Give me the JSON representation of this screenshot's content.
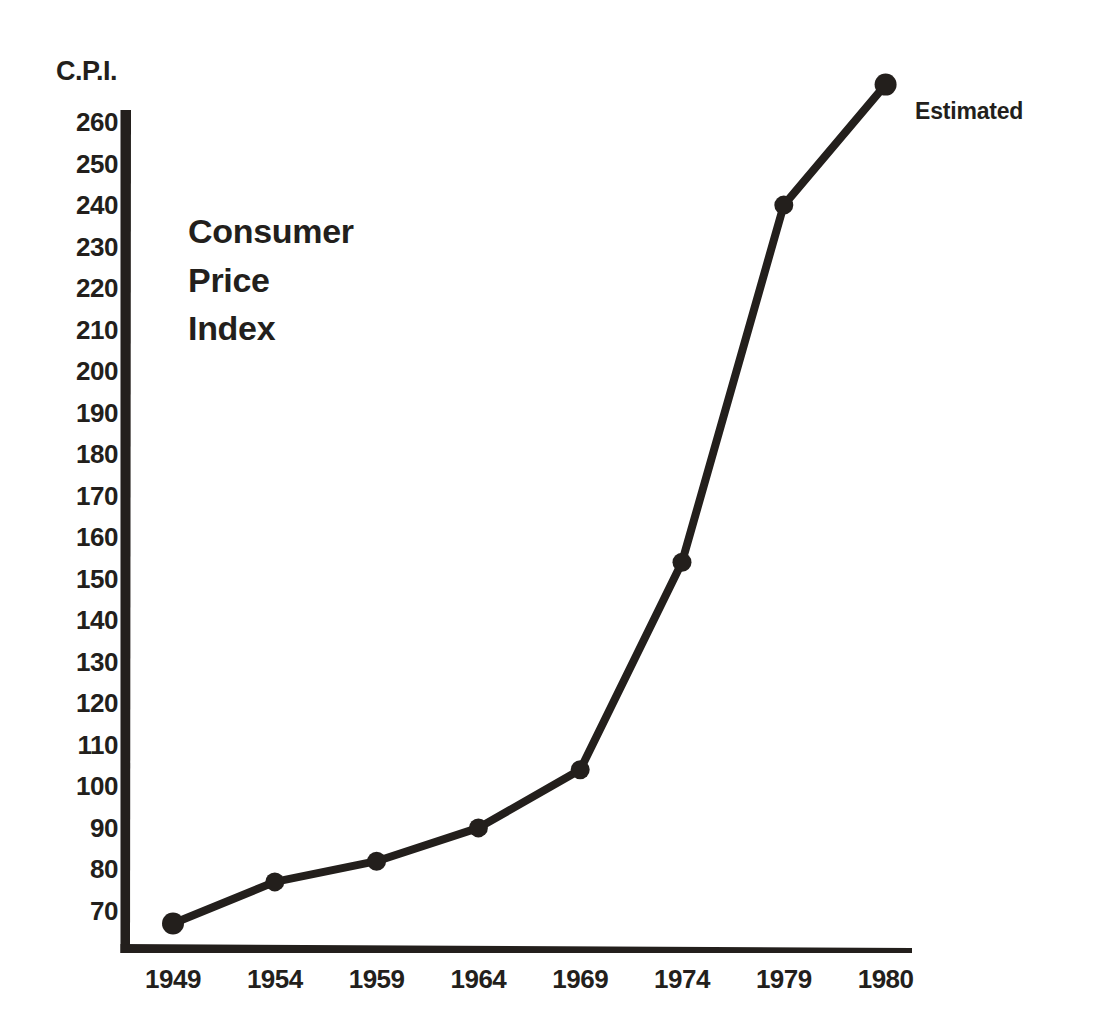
{
  "chart_data": {
    "type": "line",
    "title": "Consumer Price Index",
    "title_lines": [
      "Consumer",
      "Price",
      "Index"
    ],
    "xlabel": "",
    "ylabel": "C.P.I.",
    "categories": [
      "1949",
      "1954",
      "1959",
      "1964",
      "1969",
      "1974",
      "1979",
      "1980"
    ],
    "values": [
      67,
      77,
      82,
      90,
      104,
      154,
      240,
      269
    ],
    "series": [
      {
        "name": "Consumer Price Index",
        "values": [
          67,
          77,
          82,
          90,
          104,
          154,
          240,
          269
        ]
      }
    ],
    "ylim": [
      60,
      265
    ],
    "ytick_labels": [
      "260",
      "250",
      "240",
      "230",
      "220",
      "210",
      "200",
      "190",
      "180",
      "170",
      "160",
      "150",
      "140",
      "130",
      "120",
      "110",
      "100",
      "90",
      "80",
      "70"
    ],
    "ytick_values": [
      260,
      250,
      240,
      230,
      220,
      210,
      200,
      190,
      180,
      170,
      160,
      150,
      140,
      130,
      120,
      110,
      100,
      90,
      80,
      70
    ],
    "grid": false,
    "legend": null,
    "annotations": [
      {
        "text": "Estimated",
        "attached_to_category": "1980",
        "position": "right-of-last-point"
      }
    ],
    "markers": "filled-circle",
    "colors": {
      "ink": "#231f1c",
      "background": "#ffffff",
      "line": "#231f1c",
      "marker": "#231f1c"
    }
  }
}
